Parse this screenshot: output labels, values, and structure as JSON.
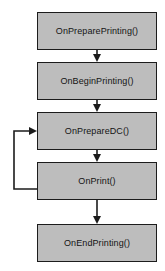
{
  "diagram": {
    "type": "flowchart",
    "background_color": "#ffffff",
    "node_fill_color": "#bdbdbd",
    "node_border_color": "#1c1c1c",
    "edge_color": "#1c1c1c",
    "nodes": [
      {
        "id": "n1",
        "label": "OnPreparePrinting()"
      },
      {
        "id": "n2",
        "label": "OnBeginPrinting()"
      },
      {
        "id": "n3",
        "label": "OnPrepareDC()"
      },
      {
        "id": "n4",
        "label": "OnPrint()"
      },
      {
        "id": "n5",
        "label": "OnEndPrinting()"
      }
    ],
    "edges": [
      {
        "from": "n1",
        "to": "n2",
        "style": "straight-down",
        "arrow": true
      },
      {
        "from": "n2",
        "to": "n3",
        "style": "straight-down",
        "arrow": true
      },
      {
        "from": "n3",
        "to": "n4",
        "style": "straight-down",
        "arrow": true
      },
      {
        "from": "n4",
        "to": "n3",
        "style": "left-loop-back",
        "arrow": true
      },
      {
        "from": "n4",
        "to": "n5",
        "style": "straight-down",
        "arrow": true
      }
    ]
  }
}
